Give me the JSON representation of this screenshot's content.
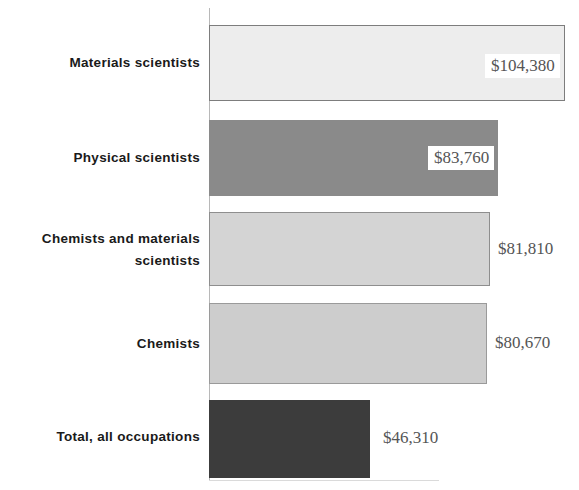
{
  "chart_data": {
    "type": "bar",
    "orientation": "horizontal",
    "title": "",
    "subtitle": "",
    "xlabel": "",
    "ylabel": "",
    "grid": false,
    "legend": null,
    "xlim": [
      0,
      104380
    ],
    "categories": [
      "Materials scientists",
      "Physical scientists",
      "Chemists and materials\nscientists",
      "Chemists",
      "Total, all occupations"
    ],
    "values": [
      104380,
      83760,
      81810,
      80670,
      46310
    ],
    "value_labels": [
      "$104,380",
      "$83,760",
      "$81,810",
      "$80,670",
      "$46,310"
    ],
    "bar_colors": [
      "#ededed",
      "#8a8a8a",
      "#d4d4d4",
      "#cdcdcd",
      "#3c3c3c"
    ],
    "bar_border_colors": [
      "#7d7d7d",
      "none",
      "#8e8e8e",
      "#9a9a9a",
      "none"
    ],
    "label_positions": [
      "inside-end",
      "inside-end",
      "outside-end",
      "outside-end",
      "outside-end"
    ]
  },
  "bars": [
    {
      "label": "Materials scientists",
      "value": "$104,380"
    },
    {
      "label": "Physical scientists",
      "value": "$83,760"
    },
    {
      "label": "Chemists and materials\nscientists",
      "value": "$81,810"
    },
    {
      "label": "Chemists",
      "value": "$80,670"
    },
    {
      "label": "Total, all occupations",
      "value": "$46,310"
    }
  ]
}
